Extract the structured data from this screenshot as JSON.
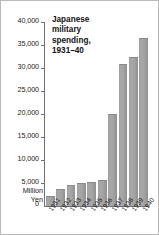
{
  "chart_data": {
    "type": "bar",
    "title_lines": [
      "Japanese",
      "military",
      "spending,",
      "1931–40"
    ],
    "categories": [
      "1931",
      "1932",
      "1933",
      "1934",
      "1935",
      "1936",
      "1937",
      "1938",
      "1939",
      "1940"
    ],
    "values": [
      2200,
      3700,
      4600,
      4900,
      5200,
      5700,
      20100,
      30800,
      32300,
      36500
    ],
    "xlabel": "",
    "ylabel": "Million Yen",
    "ylabel_lines": [
      "Million",
      "Yen"
    ],
    "ylim": [
      0,
      40000
    ],
    "ytick_values": [
      40000,
      35000,
      30000,
      25000,
      20000,
      15000,
      10000,
      5000,
      0
    ],
    "ytick_labels": [
      "40,000",
      "35,000",
      "30,000",
      "25,000",
      "20,000",
      "15,000",
      "10,000",
      "5,000",
      "0"
    ],
    "zero_label": "0",
    "grid": false,
    "legend": null,
    "bar_color": "#a3a3a3",
    "axis_color": "#6f6f6f",
    "border_color": "#b9b9b9",
    "background": "#ffffff"
  }
}
